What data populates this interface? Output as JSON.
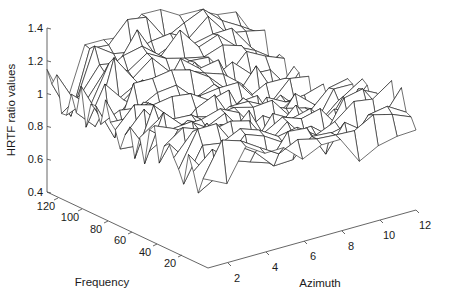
{
  "chart_data": {
    "type": "surface",
    "title": "",
    "zlabel": "HRTF ratio values",
    "xlabel": "Frequency",
    "ylabel": "Azimuth",
    "zlim": [
      0.4,
      1.4
    ],
    "z_ticks": [
      "0.4",
      "0.6",
      "0.8",
      "1",
      "1.2",
      "1.4"
    ],
    "frequency_ticks": [
      "120",
      "100",
      "80",
      "60",
      "40",
      "20"
    ],
    "azimuth_ticks": [
      "2",
      "4",
      "6",
      "8",
      "10",
      "12"
    ],
    "frequency_range": [
      1,
      128
    ],
    "azimuth_range": [
      1,
      12
    ],
    "grid": false,
    "mesh_color": "#111111"
  }
}
